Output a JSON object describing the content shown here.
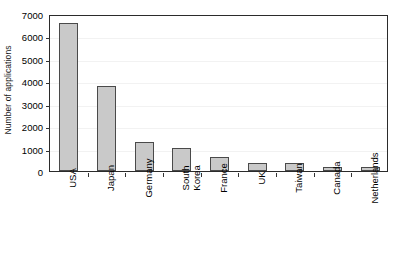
{
  "chart_data": {
    "type": "bar",
    "title": "",
    "subtitle": "",
    "xlabel": "",
    "ylabel": "Number of applications",
    "ylim": [
      0,
      7000
    ],
    "ytick_step": 1000,
    "yticks": [
      0,
      1000,
      2000,
      3000,
      4000,
      5000,
      6000,
      7000
    ],
    "ytick_labels": [
      "0",
      "1000",
      "2000",
      "3000",
      "4000",
      "5000",
      "6000",
      "7000"
    ],
    "grid": true,
    "legend": false,
    "legend_position": "none",
    "bar_fill_color": "#c9c9c9",
    "bar_edge_color": "#4a4a4a",
    "axis_color": "#2b2b2b",
    "categories": [
      "USA",
      "Japan",
      "Germany",
      "South\nKorea",
      "France",
      "UK",
      "Taiwan",
      "Canada",
      "Netherlands"
    ],
    "category_labels": [
      "USA",
      "Japan",
      "Germany",
      "South Korea",
      "France",
      "UK",
      "Taiwan",
      "Canada",
      "Netherlands"
    ],
    "values": [
      6600,
      3790,
      1300,
      1010,
      640,
      370,
      370,
      180,
      180
    ]
  }
}
